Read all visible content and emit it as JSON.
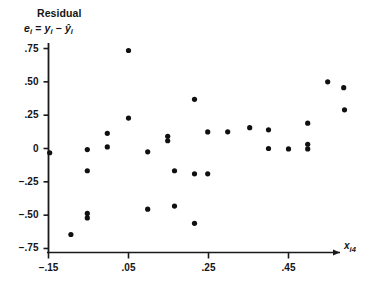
{
  "figure": {
    "title": "Residual",
    "equation_parts": {
      "e": "e",
      "e_sub": "i",
      "eq": "=",
      "y": "y",
      "y_sub": "i",
      "minus": "−",
      "yhat": "ŷ",
      "yhat_sub": "i"
    },
    "equation_plain": "eᵢ = yᵢ − ŷᵢ"
  },
  "axes": {
    "y_ticks": [
      ".75",
      ".50",
      ".25",
      "0",
      "−.25",
      "−.50",
      "−.75"
    ],
    "x_ticks": [
      "−.15",
      ".05",
      ".25",
      ".45"
    ],
    "x_axis_label": "x",
    "x_axis_label_sub": "i4"
  },
  "style": {
    "axis_color": "#1a1a1a",
    "point_color": "#101010",
    "background": "#ffffff",
    "point_radius": 2.6
  },
  "chart_data": {
    "type": "scatter",
    "title": "Residual",
    "xlabel": "x_i4",
    "ylabel": "e_i = y_i - yhat_i",
    "xlim": [
      -0.15,
      0.57
    ],
    "ylim": [
      -0.78,
      0.78
    ],
    "xticks": [
      -0.15,
      0.05,
      0.25,
      0.45
    ],
    "yticks": [
      -0.75,
      -0.5,
      -0.25,
      0,
      0.25,
      0.5,
      0.75
    ],
    "grid": false,
    "legend": null,
    "series": [
      {
        "name": "residuals",
        "x": [
          -0.147,
          -0.094,
          -0.053,
          -0.053,
          -0.053,
          -0.053,
          -0.003,
          -0.003,
          0.05,
          0.05,
          0.098,
          0.098,
          0.148,
          0.148,
          0.165,
          0.165,
          0.215,
          0.215,
          0.215,
          0.248,
          0.248,
          0.298,
          0.353,
          0.4,
          0.4,
          0.45,
          0.498,
          0.498,
          0.498,
          0.548,
          0.588,
          0.59
        ],
        "y": [
          -0.032,
          -0.645,
          -0.008,
          -0.167,
          -0.487,
          -0.521,
          0.114,
          0.012,
          0.735,
          0.228,
          -0.025,
          -0.455,
          0.091,
          0.058,
          -0.167,
          -0.432,
          -0.561,
          0.369,
          -0.19,
          0.124,
          -0.19,
          0.125,
          0.156,
          0.14,
          0.0,
          -0.003,
          0.19,
          0.032,
          -0.003,
          0.5,
          0.456,
          0.29
        ]
      }
    ]
  }
}
